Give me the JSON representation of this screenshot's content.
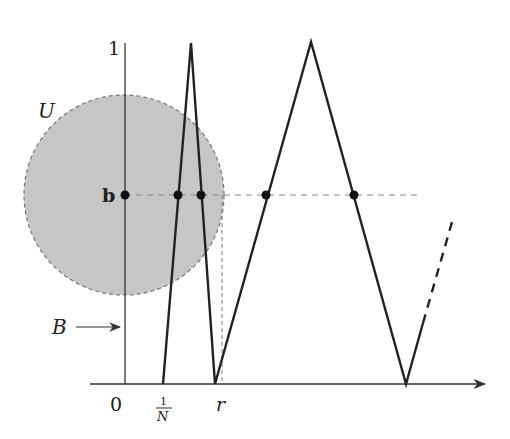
{
  "diagram": {
    "labels": {
      "y_top": "1",
      "origin": "0",
      "x_one_over_n_num": "1",
      "x_one_over_n_den": "N",
      "x_r": "r",
      "point_b": "b",
      "set_U": "U",
      "set_B": "B"
    },
    "colors": {
      "stroke": "#222222",
      "axis": "#333333",
      "disk_fill": "#c6c6c6",
      "disk_stroke": "#777777",
      "dashed": "#888888",
      "point": "#111111"
    },
    "disk": {
      "cx": 124,
      "cy": 195,
      "r": 100
    },
    "graph_polyline": [
      [
        163,
        384
      ],
      [
        191,
        43
      ],
      [
        215,
        384
      ],
      [
        311,
        42
      ],
      [
        406,
        384
      ],
      [
        423,
        323
      ]
    ],
    "dashed_continuation": [
      [
        423,
        323
      ],
      [
        452,
        222
      ]
    ],
    "level_line_y": 195,
    "intersection_points_x": [
      125,
      178,
      201,
      266,
      354
    ]
  }
}
